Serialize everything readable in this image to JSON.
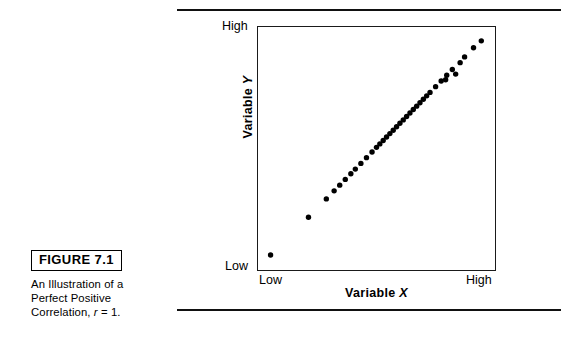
{
  "figure": {
    "tag_label": "FIGURE 7.1",
    "caption_line1": "An Illustration of a",
    "caption_line2": "Perfect Positive",
    "caption_line3_pre": "Correlation, ",
    "caption_line3_var": "r",
    "caption_line3_post": " = 1."
  },
  "chart_data": {
    "type": "scatter",
    "title": "An Illustration of a Perfect Positive Correlation, r = 1.",
    "xlabel_pre": "Variable ",
    "xlabel_var": "X",
    "ylabel_pre": "Variable ",
    "ylabel_var": "Y",
    "x_tick_labels": [
      "Low",
      "High"
    ],
    "y_tick_labels": [
      "Low",
      "High"
    ],
    "xlim": [
      0,
      100
    ],
    "ylim": [
      0,
      100
    ],
    "grid": false,
    "legend": "none",
    "correlation_r": 1,
    "marker": "filled-circle",
    "marker_color": "#000000",
    "marker_size_px": 5.4,
    "annotation": "Points fall on a single straight ascending line: a perfect positive correlation.",
    "points": [
      {
        "x": 2.5,
        "y": 3.5
      },
      {
        "x": 19.5,
        "y": 20.0
      },
      {
        "x": 27.5,
        "y": 28.0
      },
      {
        "x": 31.0,
        "y": 31.5
      },
      {
        "x": 33.5,
        "y": 34.0
      },
      {
        "x": 36.0,
        "y": 36.5
      },
      {
        "x": 38.5,
        "y": 39.0
      },
      {
        "x": 40.5,
        "y": 41.0
      },
      {
        "x": 43.0,
        "y": 43.5
      },
      {
        "x": 45.5,
        "y": 46.0
      },
      {
        "x": 48.0,
        "y": 48.5
      },
      {
        "x": 50.0,
        "y": 50.5
      },
      {
        "x": 51.5,
        "y": 52.0
      },
      {
        "x": 53.0,
        "y": 53.5
      },
      {
        "x": 54.5,
        "y": 55.0
      },
      {
        "x": 56.0,
        "y": 56.5
      },
      {
        "x": 57.5,
        "y": 58.0
      },
      {
        "x": 59.0,
        "y": 59.5
      },
      {
        "x": 60.5,
        "y": 61.0
      },
      {
        "x": 62.0,
        "y": 62.5
      },
      {
        "x": 63.5,
        "y": 64.0
      },
      {
        "x": 65.0,
        "y": 65.5
      },
      {
        "x": 66.5,
        "y": 67.0
      },
      {
        "x": 68.0,
        "y": 68.5
      },
      {
        "x": 69.5,
        "y": 70.0
      },
      {
        "x": 71.0,
        "y": 71.5
      },
      {
        "x": 72.5,
        "y": 73.0
      },
      {
        "x": 74.0,
        "y": 74.5
      },
      {
        "x": 76.5,
        "y": 77.0
      },
      {
        "x": 79.0,
        "y": 79.5
      },
      {
        "x": 81.5,
        "y": 82.0
      },
      {
        "x": 85.5,
        "y": 82.5
      },
      {
        "x": 81.0,
        "y": 80.0
      },
      {
        "x": 84.0,
        "y": 84.5
      },
      {
        "x": 87.5,
        "y": 87.5
      },
      {
        "x": 89.5,
        "y": 90.0
      },
      {
        "x": 93.5,
        "y": 94.0
      },
      {
        "x": 97.0,
        "y": 97.0
      }
    ]
  }
}
